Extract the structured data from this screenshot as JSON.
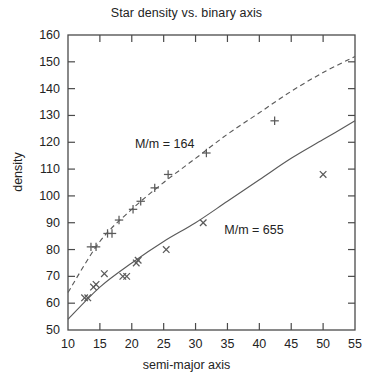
{
  "chart_data": {
    "type": "scatter",
    "title": "Star density vs. binary axis",
    "xlabel": "semi-major axis",
    "ylabel": "density",
    "xlim": [
      10,
      55
    ],
    "ylim": [
      50,
      160
    ],
    "xticks": [
      10,
      15,
      20,
      25,
      30,
      35,
      40,
      45,
      50,
      55
    ],
    "yticks": [
      50,
      60,
      70,
      80,
      90,
      100,
      110,
      120,
      130,
      140,
      150,
      160
    ],
    "grid": false,
    "legend_position": "inline-annotation",
    "series": [
      {
        "name": "M/m = 164",
        "marker": "plus",
        "line_style": "dashed",
        "annotation": "M/m = 164",
        "annotation_x": 20.5,
        "annotation_y": 119,
        "points": [
          {
            "x": 13.6,
            "y": 81
          },
          {
            "x": 14.4,
            "y": 81
          },
          {
            "x": 16.2,
            "y": 86
          },
          {
            "x": 16.9,
            "y": 86
          },
          {
            "x": 18.0,
            "y": 91
          },
          {
            "x": 20.2,
            "y": 95
          },
          {
            "x": 21.4,
            "y": 98
          },
          {
            "x": 23.6,
            "y": 103
          },
          {
            "x": 25.7,
            "y": 108
          },
          {
            "x": 31.7,
            "y": 116
          },
          {
            "x": 42.4,
            "y": 128
          }
        ],
        "fit_curve": [
          {
            "x": 10,
            "y": 64
          },
          {
            "x": 15,
            "y": 83
          },
          {
            "x": 20,
            "y": 95
          },
          {
            "x": 25,
            "y": 105
          },
          {
            "x": 30,
            "y": 114
          },
          {
            "x": 35,
            "y": 123
          },
          {
            "x": 40,
            "y": 131
          },
          {
            "x": 45,
            "y": 139
          },
          {
            "x": 50,
            "y": 146
          },
          {
            "x": 55,
            "y": 152
          }
        ]
      },
      {
        "name": "M/m = 655",
        "marker": "cross",
        "line_style": "solid",
        "annotation": "M/m = 655",
        "annotation_x": 34.5,
        "annotation_y": 87,
        "points": [
          {
            "x": 12.6,
            "y": 62
          },
          {
            "x": 13.1,
            "y": 62
          },
          {
            "x": 14.0,
            "y": 66
          },
          {
            "x": 14.4,
            "y": 67
          },
          {
            "x": 15.7,
            "y": 71
          },
          {
            "x": 18.6,
            "y": 70
          },
          {
            "x": 19.2,
            "y": 70
          },
          {
            "x": 20.7,
            "y": 75
          },
          {
            "x": 21.0,
            "y": 76
          },
          {
            "x": 25.4,
            "y": 80
          },
          {
            "x": 31.2,
            "y": 90
          },
          {
            "x": 50.0,
            "y": 108
          }
        ],
        "fit_curve": [
          {
            "x": 10,
            "y": 54
          },
          {
            "x": 15,
            "y": 66
          },
          {
            "x": 20,
            "y": 75
          },
          {
            "x": 25,
            "y": 83
          },
          {
            "x": 30,
            "y": 90
          },
          {
            "x": 35,
            "y": 98
          },
          {
            "x": 40,
            "y": 106
          },
          {
            "x": 45,
            "y": 114
          },
          {
            "x": 50,
            "y": 121
          },
          {
            "x": 55,
            "y": 128
          }
        ]
      }
    ]
  },
  "colors": {
    "axis": "#4a4a4a",
    "text": "#232323",
    "series_1": "#5a5a5a",
    "series_2": "#5a5a5a",
    "background": "#ffffff"
  }
}
